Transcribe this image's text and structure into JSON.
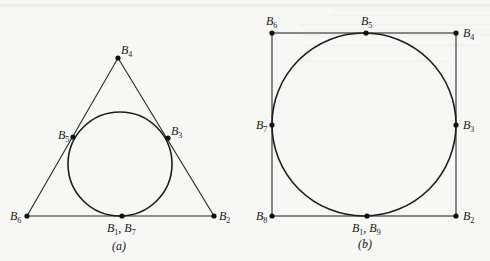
{
  "figure": {
    "panel_a": {
      "caption": "(a)",
      "shape": "triangle",
      "labels": {
        "b4": {
          "main": "B",
          "sub": "4"
        },
        "b5": {
          "main": "B",
          "sub": "5"
        },
        "b3": {
          "main": "B",
          "sub": "3"
        },
        "b6": {
          "main": "B",
          "sub": "6"
        },
        "b2": {
          "main": "B",
          "sub": "2"
        },
        "b1b7": {
          "main1": "B",
          "sub1": "1",
          "sep": ", ",
          "main2": "B",
          "sub2": "7"
        }
      }
    },
    "panel_b": {
      "caption": "(b)",
      "shape": "square",
      "labels": {
        "b6": {
          "main": "B",
          "sub": "6"
        },
        "b5": {
          "main": "B",
          "sub": "5"
        },
        "b4": {
          "main": "B",
          "sub": "4"
        },
        "b7": {
          "main": "B",
          "sub": "7"
        },
        "b3": {
          "main": "B",
          "sub": "3"
        },
        "b8": {
          "main": "B",
          "sub": "8"
        },
        "b2": {
          "main": "B",
          "sub": "2"
        },
        "b1b9": {
          "main1": "B",
          "sub1": "1",
          "sep": ", ",
          "main2": "B",
          "sub2": "9"
        }
      }
    }
  }
}
